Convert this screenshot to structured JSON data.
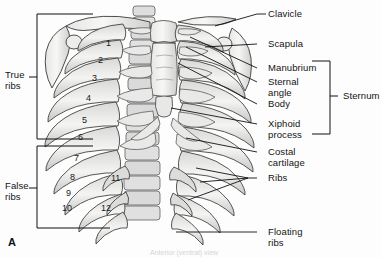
{
  "figure": {
    "panel_letter": "A",
    "faint_caption": "Anterior (ventral) view",
    "colors": {
      "background": "#fdfdfd",
      "bone_fill": "#f2f2f0",
      "bone_shade": "#c9c9c7",
      "cartilage_fill": "#e3e3e1",
      "outline": "#3a3a3a",
      "leader_line": "#111111",
      "text": "#141414"
    }
  },
  "labels": {
    "right": [
      {
        "id": "clavicle",
        "text": "Clavicle"
      },
      {
        "id": "scapula",
        "text": "Scapula"
      },
      {
        "id": "manubrium",
        "text": "Manubrium"
      },
      {
        "id": "sternal_angle",
        "text": "Sternal\nangle"
      },
      {
        "id": "body",
        "text": "Body"
      },
      {
        "id": "xiphoid_process",
        "text": "Xiphoid\nprocess"
      },
      {
        "id": "costal_cartilage",
        "text": "Costal\ncartilage"
      },
      {
        "id": "ribs",
        "text": "Ribs"
      },
      {
        "id": "floating_ribs",
        "text": "Floating\nribs"
      }
    ],
    "brackets": [
      {
        "id": "true_ribs",
        "text": "True\nribs"
      },
      {
        "id": "false_ribs",
        "text": "False\nribs"
      },
      {
        "id": "sternum",
        "text": "Sternum"
      }
    ]
  },
  "rib_numbers": [
    {
      "n": "1"
    },
    {
      "n": "2"
    },
    {
      "n": "3"
    },
    {
      "n": "4"
    },
    {
      "n": "5"
    },
    {
      "n": "6"
    },
    {
      "n": "7"
    },
    {
      "n": "8"
    },
    {
      "n": "9"
    },
    {
      "n": "10"
    },
    {
      "n": "11"
    },
    {
      "n": "12"
    }
  ]
}
